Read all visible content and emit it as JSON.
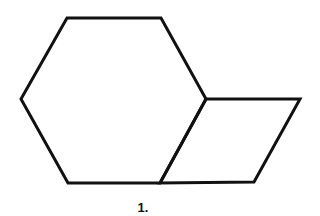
{
  "figure": {
    "label": "1.",
    "stroke_color": "#111111",
    "shapes": [
      {
        "name": "hexagon",
        "points": "67,18 161,18 206,99 160,183 68,183 21,99"
      },
      {
        "name": "rhombus",
        "points": "206,99 300,99 254,182 160,183"
      }
    ]
  }
}
